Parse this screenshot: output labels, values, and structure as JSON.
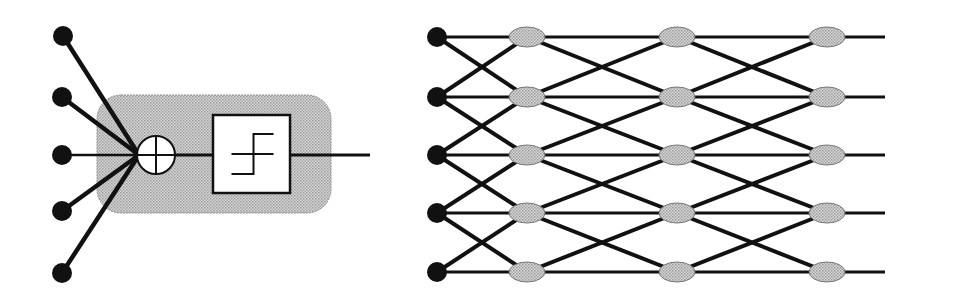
{
  "figure": {
    "width": 967,
    "height": 305,
    "background": "#ffffff",
    "ink_color": "#111111",
    "shade_color": "#c8c8c8"
  },
  "neuron_diagram": {
    "description": "Single artificial neuron: weighted inputs summed then passed through step threshold",
    "inputs": [
      {
        "x": 63,
        "y": 36
      },
      {
        "x": 62,
        "y": 97
      },
      {
        "x": 62,
        "y": 155
      },
      {
        "x": 62,
        "y": 211
      },
      {
        "x": 62,
        "y": 273
      }
    ],
    "input_node_radius": 10,
    "body": {
      "x": 97,
      "y": 95,
      "width": 234,
      "height": 118,
      "radius": 24
    },
    "summation": {
      "x": 156,
      "y": 155,
      "r": 19,
      "symbol": "sum-circle-plus"
    },
    "activation": {
      "x": 213,
      "y": 115,
      "width": 77,
      "height": 78,
      "function": "step-threshold"
    },
    "output_line": {
      "x1": 290,
      "y1": 155,
      "x2": 370,
      "y2": 155
    }
  },
  "network_diagram": {
    "description": "Layered network: 5 inputs, 3 hidden layers of 5 nodes, each node linked to same and adjacent rows",
    "rows_y": [
      37,
      97,
      155,
      213,
      272
    ],
    "input_x": 437,
    "input_node_radius": 10,
    "layers_x": [
      527,
      677,
      827
    ],
    "node_rx": 18,
    "node_ry": 10,
    "output_end_x": 885
  }
}
